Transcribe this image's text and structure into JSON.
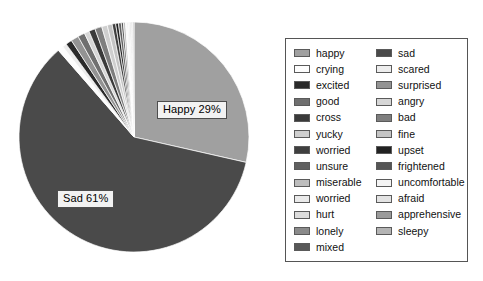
{
  "chart_data": {
    "type": "pie",
    "title": "",
    "labels_shown": [
      "Happy 29%",
      "Sad 61%"
    ],
    "legend_position": "right",
    "categories": [
      "happy",
      "sad",
      "crying",
      "scared",
      "excited",
      "surprised",
      "good",
      "angry",
      "cross",
      "bad",
      "yucky",
      "fine",
      "worried",
      "upset",
      "unsure",
      "frightened",
      "miserable",
      "uncomfortable",
      "worried",
      "afraid",
      "hurt",
      "apprehensive",
      "lonely",
      "sleepy",
      "mixed"
    ],
    "values": [
      29,
      61,
      0.8,
      0.6,
      0.9,
      1.1,
      1.0,
      0.7,
      0.9,
      1.0,
      0.8,
      0.7,
      0.5,
      0.4,
      0.4,
      0.3,
      0.3,
      0.2,
      0.2,
      0.2,
      0.2,
      0.1,
      0.1,
      0.1,
      0.1
    ],
    "colors": [
      "#a0a0a0",
      "#4a4a4a",
      "#fdfdfd",
      "#ededed",
      "#2a2a2a",
      "#939393",
      "#6f6f6f",
      "#d6d6d6",
      "#3a3a3a",
      "#7e7e7e",
      "#cfcfcf",
      "#c4c4c4",
      "#3f3f3f",
      "#222222",
      "#606060",
      "#555555",
      "#bdbdbd",
      "#f4f4f4",
      "#eaeaea",
      "#e3e3e3",
      "#dcdcdc",
      "#9a9a9a",
      "#8a8a8a",
      "#b4b4b4",
      "#585858"
    ]
  },
  "pie": {
    "label_happy": "Happy 29%",
    "label_sad": "Sad 61%"
  },
  "legend": {
    "left_column": [
      {
        "label": "happy",
        "color": "#a0a0a0"
      },
      {
        "label": "crying",
        "color": "#fdfdfd"
      },
      {
        "label": "excited",
        "color": "#2a2a2a"
      },
      {
        "label": "good",
        "color": "#6f6f6f"
      },
      {
        "label": "cross",
        "color": "#3a3a3a"
      },
      {
        "label": "yucky",
        "color": "#cfcfcf"
      },
      {
        "label": "worried",
        "color": "#3f3f3f"
      },
      {
        "label": "unsure",
        "color": "#606060"
      },
      {
        "label": "miserable",
        "color": "#bdbdbd"
      },
      {
        "label": "worried",
        "color": "#eaeaea"
      },
      {
        "label": "hurt",
        "color": "#dcdcdc"
      },
      {
        "label": "lonely",
        "color": "#8a8a8a"
      },
      {
        "label": "mixed",
        "color": "#585858"
      }
    ],
    "right_column": [
      {
        "label": "sad",
        "color": "#4a4a4a"
      },
      {
        "label": "scared",
        "color": "#ededed"
      },
      {
        "label": "surprised",
        "color": "#939393"
      },
      {
        "label": "angry",
        "color": "#d6d6d6"
      },
      {
        "label": "bad",
        "color": "#7e7e7e"
      },
      {
        "label": "fine",
        "color": "#c4c4c4"
      },
      {
        "label": "upset",
        "color": "#222222"
      },
      {
        "label": "frightened",
        "color": "#555555"
      },
      {
        "label": "uncomfortable",
        "color": "#f4f4f4"
      },
      {
        "label": "afraid",
        "color": "#e3e3e3"
      },
      {
        "label": "apprehensive",
        "color": "#9a9a9a"
      },
      {
        "label": "sleepy",
        "color": "#b4b4b4"
      }
    ]
  }
}
